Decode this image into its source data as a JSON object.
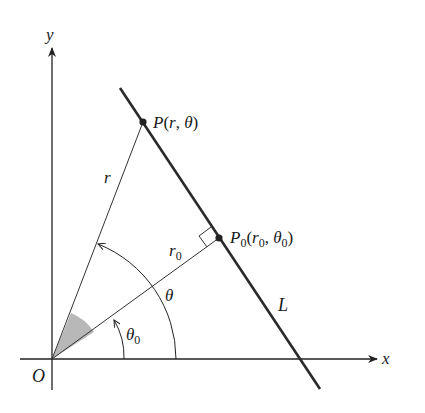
{
  "figure": {
    "axes": {
      "x_label": "x",
      "y_label": "y",
      "origin_label": "O"
    },
    "line_label": "L",
    "points": {
      "P": {
        "name": "P",
        "args_open": "(",
        "r": "r",
        "comma": ", ",
        "theta": "θ",
        "args_close": ")"
      },
      "P0": {
        "name": "P",
        "sub": "0",
        "args_open": "(",
        "r": "r",
        "r_sub": "0",
        "comma": ", ",
        "theta": "θ",
        "theta_sub": "0",
        "args_close": ")"
      }
    },
    "segment_labels": {
      "r": "r",
      "r0": "r",
      "r0_sub": "0"
    },
    "angle_labels": {
      "theta": "θ",
      "theta0": "θ",
      "theta0_sub": "0"
    },
    "colors": {
      "stroke": "#222222",
      "shade": "#b8b8b8",
      "background": "#ffffff"
    }
  }
}
